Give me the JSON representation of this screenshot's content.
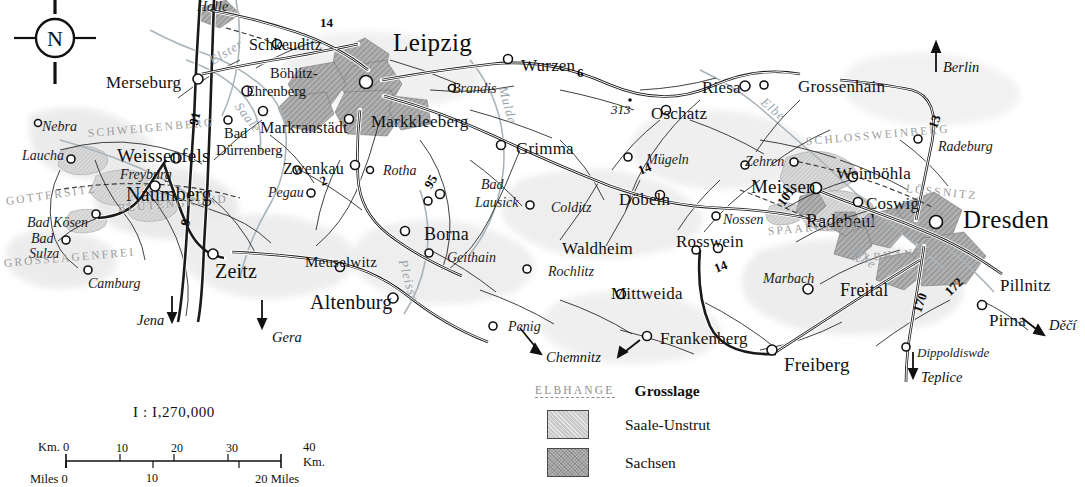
{
  "map": {
    "title": "Saale-Unstrut and Sachsen wine regions",
    "compass": {
      "north_label": "N",
      "name": "compass-rose"
    },
    "background_color": "#ffffff",
    "region_colors": {
      "saale_unstrut": "#c9c9c9",
      "sachsen": "#b4b4b4",
      "urban": "#a9a9a9",
      "water": "#9aa4ab"
    }
  },
  "cities": {
    "major": [
      {
        "label": "Leipzig",
        "x": 393,
        "y": 30
      },
      {
        "label": "Dresden",
        "x": 963,
        "y": 207
      }
    ],
    "mid": [
      {
        "label": "Merseburg",
        "x": 106,
        "y": 74
      },
      {
        "label": "Weissenfels",
        "x": 117,
        "y": 146
      },
      {
        "label": "Naumberg",
        "x": 126,
        "y": 184
      },
      {
        "label": "Zeitz",
        "x": 215,
        "y": 261
      },
      {
        "label": "Altenburg",
        "x": 310,
        "y": 292
      },
      {
        "label": "Markkleeberg",
        "x": 371,
        "y": 113
      },
      {
        "label": "Grimma",
        "x": 516,
        "y": 140
      },
      {
        "label": "Wurzen",
        "x": 521,
        "y": 57
      },
      {
        "label": "Oschatz",
        "x": 651,
        "y": 105
      },
      {
        "label": "Riesa",
        "x": 702,
        "y": 79
      },
      {
        "label": "Grossenhain",
        "x": 798,
        "y": 78
      },
      {
        "label": "Meissen",
        "x": 751,
        "y": 177
      },
      {
        "label": "Radebeul",
        "x": 806,
        "y": 212
      },
      {
        "label": "Coswig",
        "x": 866,
        "y": 195
      },
      {
        "label": "Weinböhla",
        "x": 836,
        "y": 165
      },
      {
        "label": "Döbeln",
        "x": 619,
        "y": 191
      },
      {
        "label": "Waldheim",
        "x": 562,
        "y": 240
      },
      {
        "label": "Mittweida",
        "x": 611,
        "y": 285
      },
      {
        "label": "Rosswein",
        "x": 676,
        "y": 233
      },
      {
        "label": "Frankenberg",
        "x": 660,
        "y": 330
      },
      {
        "label": "Freiberg",
        "x": 784,
        "y": 355
      },
      {
        "label": "Freital",
        "x": 840,
        "y": 281
      },
      {
        "label": "Pillnitz",
        "x": 1000,
        "y": 277
      },
      {
        "label": "Pirna",
        "x": 989,
        "y": 312
      },
      {
        "label": "Borna",
        "x": 424,
        "y": 225
      },
      {
        "label": "Meuselwitz",
        "x": 305,
        "y": 255
      },
      {
        "label": "Markranstädt",
        "x": 260,
        "y": 120
      },
      {
        "label": "Schkeuditz",
        "x": 249,
        "y": 37
      },
      {
        "label": "Zwenkau",
        "x": 283,
        "y": 161
      }
    ],
    "small": [
      {
        "label": "Böhlitz-",
        "x": 270,
        "y": 66
      },
      {
        "label": "Ehrenberg",
        "x": 246,
        "y": 84
      },
      {
        "label": "Bad",
        "x": 224,
        "y": 126
      },
      {
        "label": "Dürrenberg",
        "x": 216,
        "y": 143
      }
    ],
    "italic": [
      {
        "label": "Halle",
        "x": 197,
        "y": 0
      },
      {
        "label": "Nebra",
        "x": 42,
        "y": 120
      },
      {
        "label": "Laucha",
        "x": 22,
        "y": 149
      },
      {
        "label": "Freyburg",
        "x": 120,
        "y": 168
      },
      {
        "label": "Bad Kösen",
        "x": 27,
        "y": 216
      },
      {
        "label": "Bad",
        "x": 31,
        "y": 232
      },
      {
        "label": "Sulza",
        "x": 29,
        "y": 247
      },
      {
        "label": "Camburg",
        "x": 88,
        "y": 277
      },
      {
        "label": "Pegau",
        "x": 268,
        "y": 186
      },
      {
        "label": "Rotha",
        "x": 383,
        "y": 164
      },
      {
        "label": "Brandis",
        "x": 452,
        "y": 82
      },
      {
        "label": "Bad",
        "x": 481,
        "y": 178
      },
      {
        "label": "Lausick",
        "x": 475,
        "y": 196
      },
      {
        "label": "Geithain",
        "x": 447,
        "y": 251
      },
      {
        "label": "Colditz",
        "x": 551,
        "y": 201
      },
      {
        "label": "Rochlitz",
        "x": 548,
        "y": 265
      },
      {
        "label": "Penig",
        "x": 508,
        "y": 320
      },
      {
        "label": "Mügeln",
        "x": 646,
        "y": 153
      },
      {
        "label": "Nossen",
        "x": 723,
        "y": 213
      },
      {
        "label": "Zehren",
        "x": 745,
        "y": 155
      },
      {
        "label": "Marbach",
        "x": 763,
        "y": 272
      },
      {
        "label": "Radeburg",
        "x": 938,
        "y": 140
      },
      {
        "label": "Dippoldiswde",
        "x": 917,
        "y": 346
      }
    ]
  },
  "directions": [
    {
      "label": "Jena",
      "x": 137,
      "y": 313
    },
    {
      "label": "Gera",
      "x": 272,
      "y": 330
    },
    {
      "label": "Chemnitz",
      "x": 546,
      "y": 357
    },
    {
      "label": "Berlin",
      "x": 943,
      "y": 60
    },
    {
      "label": "Děčí",
      "x": 1049,
      "y": 325
    },
    {
      "label": "Teplice",
      "x": 928,
      "y": 378
    }
  ],
  "rivers": [
    {
      "label": "Elster",
      "x": 207,
      "y": 56
    },
    {
      "label": "Saale",
      "x": 243,
      "y": 100
    },
    {
      "label": "Mulde",
      "x": 509,
      "y": 85
    },
    {
      "label": "Elbe",
      "x": 767,
      "y": 95
    },
    {
      "label": "Elbe",
      "x": 858,
      "y": 243
    },
    {
      "label": "Pleisse",
      "x": 409,
      "y": 258
    }
  ],
  "grosslagen": [
    {
      "label": "SCHWEIGENBERG",
      "x": 88,
      "y": 128
    },
    {
      "label": "GOTTERSITZ",
      "x": 6,
      "y": 196
    },
    {
      "label": "BLÜTENGRUND",
      "x": 118,
      "y": 203
    },
    {
      "label": "GROSSLAGENFREI",
      "x": 4,
      "y": 258
    },
    {
      "label": "SCHLOSSWEINBERG",
      "x": 806,
      "y": 136
    },
    {
      "label": "LÖSSNITZ",
      "x": 906,
      "y": 183
    },
    {
      "label": "SPAARGEBIRGE",
      "x": 768,
      "y": 226
    },
    {
      "label": "ELBHANGE",
      "x": 855,
      "y": 253
    }
  ],
  "roads": [
    {
      "number": "14",
      "x": 326,
      "y": 23
    },
    {
      "number": "91",
      "x": 192,
      "y": 119
    },
    {
      "number": "9",
      "x": 185,
      "y": 223
    },
    {
      "number": "2",
      "x": 323,
      "y": 180
    },
    {
      "number": "95",
      "x": 429,
      "y": 181
    },
    {
      "number": "6",
      "x": 580,
      "y": 73
    },
    {
      "number": "14",
      "x": 641,
      "y": 169
    },
    {
      "number": "14",
      "x": 718,
      "y": 267
    },
    {
      "number": "13",
      "x": 932,
      "y": 122
    },
    {
      "number": "101",
      "x": 783,
      "y": 197
    },
    {
      "number": "170",
      "x": 915,
      "y": 303
    },
    {
      "number": "172",
      "x": 950,
      "y": 287
    }
  ],
  "spot_heights": [
    {
      "label": "313",
      "x": 617,
      "y": 107
    }
  ],
  "legend": {
    "name": "map-legend",
    "rows": [
      {
        "sample": "ELBHANGE",
        "label": "Grosslage",
        "type": "grosslage"
      },
      {
        "sample": "",
        "label": "Saale-Unstrut",
        "type": "swatch-saale"
      },
      {
        "sample": "",
        "label": "Sachsen",
        "type": "swatch-sachsen"
      }
    ]
  },
  "scale": {
    "name": "scale-bar",
    "ratio": "I : I,270,000",
    "km_label_left": "Km. 0",
    "km_label_right": "40 Km.",
    "miles_label_left": "Miles 0",
    "miles_label_right": "20 Miles",
    "km_ticks": [
      "10",
      "20",
      "30"
    ],
    "mile_ticks": [
      "10"
    ]
  }
}
